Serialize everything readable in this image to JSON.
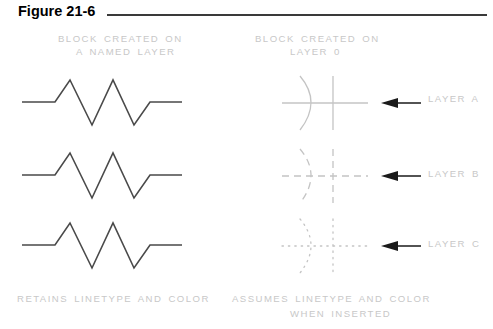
{
  "figure": {
    "title": "Figure 21-6"
  },
  "columns": {
    "left": {
      "heading_line1": "BLOCK CREATED ON",
      "heading_line2": "A NAMED LAYER",
      "caption": "RETAINS LINETYPE AND COLOR"
    },
    "right": {
      "heading_line1": "BLOCK CREATED ON",
      "heading_line2": "LAYER 0",
      "caption_line1": "ASSUMES LINETYPE AND COLOR",
      "caption_line2": "WHEN INSERTED"
    }
  },
  "rows": [
    {
      "layer_label": "LAYER A",
      "linetype": "solid"
    },
    {
      "layer_label": "LAYER B",
      "linetype": "dashed"
    },
    {
      "layer_label": "LAYER C",
      "linetype": "dotted"
    }
  ],
  "colors": {
    "title_text": "#000000",
    "rule": "#3a3a3a",
    "cad_text": "#c8c8c8",
    "zigzag_line": "#4a4a4a",
    "light_line": "#cccccc",
    "arrow": "#1a1a1a"
  }
}
